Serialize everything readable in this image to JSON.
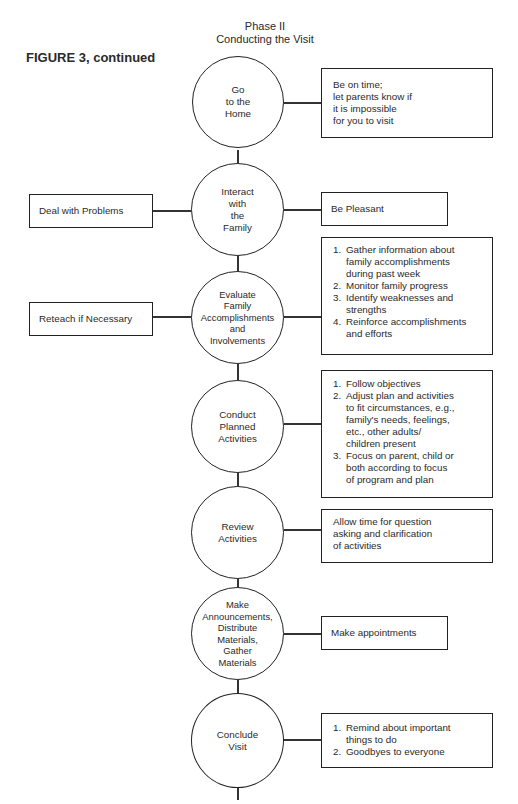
{
  "header": {
    "phase_title": "Phase II",
    "phase_subtitle": "Conducting the Visit",
    "figure_label": "FIGURE 3, continued"
  },
  "nodes": [
    {
      "label": "Go\nto the\nHome",
      "right": {
        "type": "text",
        "text": "Be on time;\nlet parents know if\nit is impossible\nfor you to visit"
      }
    },
    {
      "label": "Interact\nwith\nthe\nFamily",
      "left": "Deal with Problems",
      "right": {
        "type": "text",
        "text": "Be Pleasant"
      }
    },
    {
      "label": "Evaluate\nFamily\nAccomplishments\nand\nInvolvements",
      "left": "Reteach if Necessary",
      "right": {
        "type": "list",
        "items": [
          "Gather information about\nfamily accomplishments\nduring past week",
          "Monitor family progress",
          "Identify weaknesses and\nstrengths",
          "Reinforce accomplishments\nand efforts"
        ]
      }
    },
    {
      "label": "Conduct\nPlanned\nActivities",
      "right": {
        "type": "list",
        "items": [
          "Follow objectives",
          "Adjust plan and activities\nto fit circumstances, e.g.,\nfamily's needs, feelings,\netc., other adults/\nchildren present",
          "Focus on parent, child or\nboth according to focus\nof program and plan"
        ]
      }
    },
    {
      "label": "Review\nActivities",
      "right": {
        "type": "text",
        "text": "Allow time for question\nasking and clarification\nof activities"
      }
    },
    {
      "label": "Make\nAnnouncements,\nDistribute\nMaterials,\nGather\nMaterials",
      "right": {
        "type": "text",
        "text": "Make appointments"
      }
    },
    {
      "label": "Conclude\nVisit",
      "right": {
        "type": "list",
        "items": [
          "Remind about important\nthings to do",
          "Goodbyes to everyone"
        ]
      }
    }
  ],
  "list_numbers": [
    "1.",
    "2.",
    "3.",
    "4."
  ]
}
